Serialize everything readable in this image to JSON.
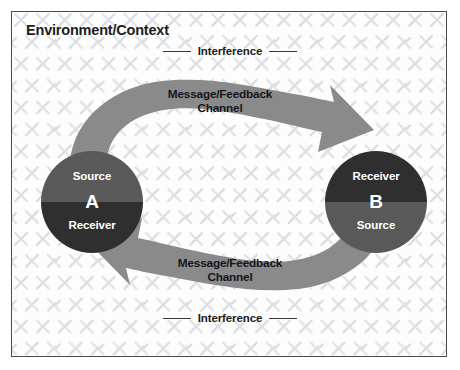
{
  "diagram": {
    "title": "Environment/Context",
    "interference_top": "Interference",
    "interference_bottom": "Interference",
    "channel_top": "Message/Feedback\nChannel",
    "channel_bottom": "Message/Feedback\nChannel",
    "node_a": {
      "top_role": "Source",
      "letter": "A",
      "bottom_role": "Receiver"
    },
    "node_b": {
      "top_role": "Receiver",
      "letter": "B",
      "bottom_role": "Source"
    },
    "colors": {
      "border": "#4a4a4a",
      "background": "#fdfdfd",
      "texture": "#d9dde2",
      "band": "#8a8a8a",
      "band_dark": "#6f6f6f",
      "circle_light": "#595959",
      "circle_dark": "#2f2f2f",
      "text_dark": "#1c1c1c",
      "text_light": "#ffffff"
    }
  }
}
